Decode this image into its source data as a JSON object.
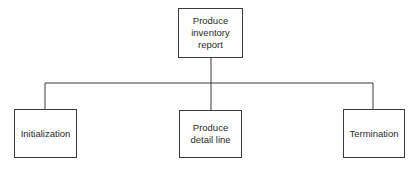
{
  "diagram": {
    "type": "structure-chart",
    "root": {
      "id": "produce-inventory-report",
      "label": "Produce\ninventory\nreport"
    },
    "children": [
      {
        "id": "initialization",
        "label": "Initialization"
      },
      {
        "id": "produce-detail-line",
        "label": "Produce\ndetail line"
      },
      {
        "id": "termination",
        "label": "Termination"
      }
    ],
    "edges": [
      {
        "from": "produce-inventory-report",
        "to": "initialization"
      },
      {
        "from": "produce-inventory-report",
        "to": "produce-detail-line"
      },
      {
        "from": "produce-inventory-report",
        "to": "termination"
      }
    ],
    "colors": {
      "line": "#3a3a3a",
      "background": "#ffffff",
      "text": "#2a2a2a"
    }
  }
}
